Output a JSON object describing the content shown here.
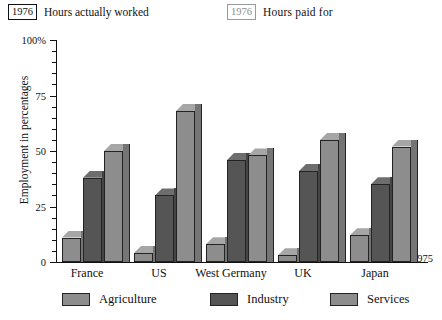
{
  "header": {
    "items": [
      {
        "year": "1976",
        "label": "Hours actually worked",
        "style": "solid"
      },
      {
        "year": "1976",
        "label": "Hours  paid for",
        "style": "light"
      }
    ]
  },
  "axis": {
    "y_title": "Employment in percentages",
    "top_label": "100%",
    "tick_labels": [
      "100%",
      "75",
      "50",
      "25",
      "0"
    ],
    "right_year": "1975"
  },
  "legend": {
    "items": [
      {
        "label": "Agriculture",
        "color": "#8d8d8d"
      },
      {
        "label": "Industry",
        "color": "#555555"
      },
      {
        "label": "Services",
        "color": "#8d8d8d"
      }
    ]
  },
  "chart_data": {
    "type": "bar",
    "title": "",
    "subtitle": "",
    "xlabel": "",
    "ylabel": "Employment in percentages",
    "ylim": [
      0,
      100
    ],
    "yticks": [
      0,
      25,
      50,
      75,
      100
    ],
    "grid": false,
    "legend_position": "bottom",
    "categories": [
      "France",
      "US",
      "West Germany",
      "UK",
      "Japan"
    ],
    "series": [
      {
        "name": "Agriculture",
        "color": "#8d8d8d",
        "values": [
          11,
          4,
          8,
          3,
          12
        ]
      },
      {
        "name": "Industry",
        "color": "#555555",
        "values": [
          38,
          30,
          46,
          41,
          35
        ]
      },
      {
        "name": "Services",
        "color": "#8d8d8d",
        "values": [
          50,
          68,
          48,
          55,
          52
        ]
      }
    ],
    "annotations": [
      {
        "text": "1976",
        "note": "Hours actually worked"
      },
      {
        "text": "1976",
        "note": "Hours paid for"
      },
      {
        "text": "1975",
        "note": "axis end year"
      }
    ]
  },
  "colors": {
    "agriculture": "#8d8d8d",
    "industry": "#555555",
    "services": "#8d8d8d",
    "agriculture_top": "#a6a6a6",
    "industry_top": "#6e6e6e",
    "services_side": "#757575",
    "outline": "#232323",
    "text": "#111111",
    "muted": "#8e8e8e"
  }
}
